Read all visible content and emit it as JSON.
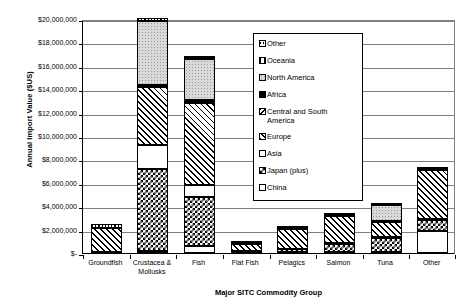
{
  "chart_data": {
    "type": "bar",
    "subtype": "stacked",
    "title": "",
    "xlabel": "Major SITC Commodity Group",
    "ylabel": "Annual Import Value ($US)",
    "ylim": [
      0,
      20000000
    ],
    "ytick_values": [
      0,
      2000000,
      4000000,
      6000000,
      8000000,
      10000000,
      12000000,
      14000000,
      16000000,
      18000000,
      20000000
    ],
    "ytick_labels": [
      "$-",
      "$2,000,000",
      "$4,000,000",
      "$6,000,000",
      "$8,000,000",
      "$10,000,000",
      "$12,000,000",
      "$14,000,000",
      "$16,000,000",
      "$18,000,000",
      "$20,000,000"
    ],
    "grid": true,
    "legend_position": "inside-top-center",
    "categories": [
      "Groundfish",
      "Crustacea &\nMollusks",
      "Fish",
      "Flat Fish",
      "Pelagics",
      "Salmon",
      "Tuna",
      "Other"
    ],
    "series": [
      {
        "name": "China",
        "pattern": "white",
        "values": [
          100000,
          200000,
          600000,
          40000,
          60000,
          80000,
          50000,
          1900000
        ]
      },
      {
        "name": "Japan (plus)",
        "pattern": "checkerboard",
        "values": [
          0,
          7000000,
          4200000,
          60000,
          250000,
          700000,
          1200000,
          900000
        ]
      },
      {
        "name": "Asia",
        "pattern": "white",
        "values": [
          0,
          2000000,
          1000000,
          40000,
          60000,
          60000,
          80000,
          80000
        ]
      },
      {
        "name": "Europe",
        "pattern": "diagonal-hatch",
        "values": [
          2000000,
          5000000,
          7000000,
          650000,
          1700000,
          2300000,
          1300000,
          4200000
        ]
      },
      {
        "name": "Central and South America",
        "pattern": "fine-diagonal",
        "values": [
          0,
          100000,
          100000,
          20000,
          30000,
          40000,
          50000,
          60000
        ]
      },
      {
        "name": "Africa",
        "pattern": "solid-black",
        "values": [
          50000,
          100000,
          200000,
          20000,
          30000,
          30000,
          30000,
          30000
        ]
      },
      {
        "name": "North America",
        "pattern": "light-dotted",
        "values": [
          0,
          5400000,
          3500000,
          10000,
          30000,
          50000,
          1400000,
          10000
        ]
      },
      {
        "name": "Oceania",
        "pattern": "vertical-bar",
        "values": [
          0,
          50000,
          50000,
          10000,
          20000,
          20000,
          20000,
          20000
        ]
      },
      {
        "name": "Other",
        "pattern": "horizontal-dash",
        "values": [
          300000,
          250000,
          100000,
          50000,
          120000,
          120000,
          70000,
          70000
        ]
      }
    ],
    "totals": [
      2450000,
      20100000,
      16750000,
      900000,
      2300000,
      3400000,
      4200000,
      7270000
    ]
  },
  "legend": {
    "items": [
      {
        "label": "Other",
        "swatch": "horizontal-dash-swatch"
      },
      {
        "label": "Oceania",
        "swatch": "vertical-bar-swatch"
      },
      {
        "label": "North America",
        "swatch": "light-dotted-swatch"
      },
      {
        "label": "Africa",
        "swatch": "solid-black-swatch"
      },
      {
        "label": "Central and South\n  America",
        "swatch": "fine-diagonal-swatch"
      },
      {
        "label": "Europe",
        "swatch": "diagonal-hatch-swatch"
      },
      {
        "label": "Asia",
        "swatch": "white-swatch"
      },
      {
        "label": "Japan (plus)",
        "swatch": "checkerboard-swatch"
      },
      {
        "label": "China",
        "swatch": "white-swatch"
      }
    ]
  }
}
